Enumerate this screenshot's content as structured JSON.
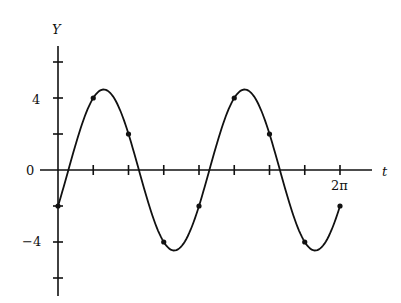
{
  "chart_data": {
    "type": "line",
    "title": "",
    "xlabel": "t",
    "ylabel": "Y",
    "x_tick_labels": [
      {
        "value": 6.2832,
        "label": "2π"
      }
    ],
    "y_tick_labels": [
      {
        "value": 4,
        "label": "4"
      },
      {
        "value": 0,
        "label": "0"
      },
      {
        "value": -4,
        "label": "-4"
      }
    ],
    "x_ticks": [
      0,
      0.7854,
      1.5708,
      2.3562,
      3.1416,
      3.927,
      4.7124,
      5.4978,
      6.2832
    ],
    "y_ticks": [
      -6,
      -4,
      -2,
      0,
      2,
      4,
      6
    ],
    "xlim": [
      0,
      6.9
    ],
    "ylim": [
      -7,
      7.0
    ],
    "grid": false,
    "series": [
      {
        "name": "Y(t)",
        "curve": "4 sin(2t) - 2 cos(2t)",
        "points": [
          {
            "x": 0,
            "y": -2
          },
          {
            "x": 0.7854,
            "y": 4
          },
          {
            "x": 1.5708,
            "y": 2
          },
          {
            "x": 2.3562,
            "y": -4
          },
          {
            "x": 3.1416,
            "y": -2
          },
          {
            "x": 3.927,
            "y": 4
          },
          {
            "x": 4.7124,
            "y": 2
          },
          {
            "x": 5.4978,
            "y": -4
          },
          {
            "x": 6.2832,
            "y": -2
          }
        ]
      }
    ]
  },
  "labels": {
    "y_axis": "Y",
    "x_axis": "t",
    "y4": "4",
    "y0": "0",
    "yneg4": "−4",
    "x2pi": "2π"
  }
}
